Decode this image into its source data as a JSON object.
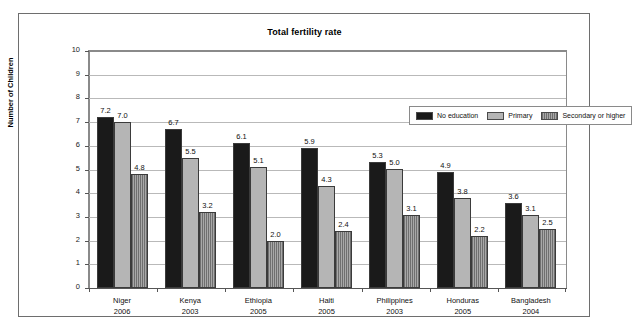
{
  "chart_data": {
    "type": "bar",
    "title": "Total fertility rate",
    "xlabel": "",
    "ylabel": "Number of Children",
    "ylim": [
      0,
      10
    ],
    "ytick_labels": [
      "10",
      "9",
      "8",
      "7",
      "6",
      "5",
      "4",
      "3",
      "2",
      "1",
      "0"
    ],
    "grid": true,
    "legend_position": "top-right inside plot",
    "categories": [
      "Niger",
      "Kenya",
      "Ethiopia",
      "Haiti",
      "Philippines",
      "Honduras",
      "Bangladesh"
    ],
    "category_years": [
      "2006",
      "2003",
      "2005",
      "2005",
      "2003",
      "2005",
      "2004"
    ],
    "series": [
      {
        "name": "No education",
        "color": "#1a1a1a",
        "values": [
          7.2,
          6.7,
          6.1,
          5.9,
          5.3,
          4.9,
          3.6
        ],
        "labels": [
          "7.2",
          "6.7",
          "6.1",
          "5.9",
          "5.3",
          "4.9",
          "3.6"
        ]
      },
      {
        "name": "Primary",
        "color": "#b5b5b5",
        "values": [
          7.0,
          5.5,
          5.1,
          4.3,
          5.0,
          3.8,
          3.1
        ],
        "labels": [
          "7.0",
          "5.5",
          "5.1",
          "4.3",
          "5.0",
          "3.8",
          "3.1"
        ]
      },
      {
        "name": "Secondary or higher",
        "color": "#8d8d8d",
        "values": [
          4.8,
          3.2,
          2.0,
          2.4,
          3.1,
          2.2,
          2.5
        ],
        "labels": [
          "4.8",
          "3.2",
          "2.0",
          "2.4",
          "3.1",
          "2.2",
          "2.5"
        ]
      }
    ]
  },
  "legend": {
    "items": [
      {
        "label": "No education"
      },
      {
        "label": "Primary"
      },
      {
        "label": "Secondary or higher"
      }
    ]
  }
}
